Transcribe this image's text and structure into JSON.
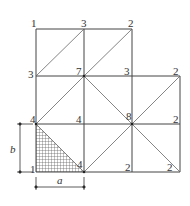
{
  "diagram": {
    "node_labels": {
      "r0c0": "1",
      "r0c1": "3",
      "r0c2": "2",
      "r1c0": "3",
      "r1c1": "7",
      "r1c2": "3",
      "r1c3": "2",
      "r2c0": "4",
      "r2c1": "4",
      "r2c2": "8",
      "r2c3": "2",
      "r3c0": "1",
      "r3c1": "4",
      "r3c2": "2",
      "r3c3": "2"
    },
    "dimension_a": "a",
    "dimension_b": "b",
    "colors": {
      "line": "#444444",
      "hatch": "#555555"
    }
  }
}
